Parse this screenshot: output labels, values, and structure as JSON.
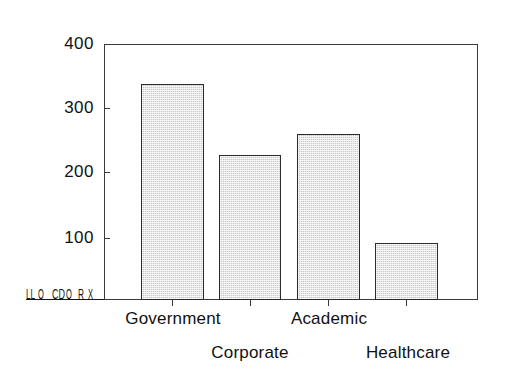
{
  "chart_data": {
    "type": "bar",
    "title": "",
    "subtitle": "",
    "xlabel": "",
    "ylabel": "",
    "categories": [
      "Government",
      "Corporate",
      "Academic",
      "Healthcare"
    ],
    "values": [
      335,
      220,
      250,
      85
    ],
    "series": [
      {
        "name": "",
        "values": [
          335,
          220,
          250,
          85
        ]
      }
    ],
    "ylim": [
      0,
      400
    ],
    "y_ticks": [
      100,
      200,
      300,
      400
    ],
    "y_tick_labels": [
      "100",
      "200",
      "300",
      "400"
    ],
    "grid": false,
    "legend": false,
    "legend_position": "none",
    "annotations": [],
    "bar_fill_color": "#c8c8c8",
    "bar_edge_color": "#2b2b2b",
    "axis_color": "#3a3a3a",
    "background_color": "#ffffff",
    "label_layout": "staggered-two-rows",
    "origin_artifact_text": "LL.OCHOX"
  },
  "axes": {
    "y_ticks": [
      {
        "label": "400",
        "value": 400,
        "y": 44
      },
      {
        "label": "300",
        "value": 300,
        "y": 108
      },
      {
        "label": "200",
        "value": 200,
        "y": 172
      },
      {
        "label": "100",
        "value": 100,
        "y": 238
      }
    ],
    "x_ticks": [
      {
        "x": 172
      },
      {
        "x": 250
      },
      {
        "x": 328
      },
      {
        "x": 406
      }
    ]
  },
  "bars": [
    {
      "name": "Government",
      "value": 335,
      "left": 141,
      "width": 63,
      "height": 216,
      "row": 1,
      "label_left": 103,
      "label_width": 140
    },
    {
      "name": "Corporate",
      "value": 220,
      "left": 219,
      "width": 62,
      "height": 145,
      "row": 2,
      "label_left": 185,
      "label_width": 130
    },
    {
      "name": "Academic",
      "value": 250,
      "left": 297,
      "width": 63,
      "height": 166,
      "row": 1,
      "label_left": 268,
      "label_width": 122
    },
    {
      "name": "Healthcare",
      "value": 85,
      "left": 375,
      "width": 63,
      "height": 57,
      "row": 2,
      "label_left": 338,
      "label_width": 140
    }
  ],
  "origin_artifact": {
    "glyphs": [
      "LL",
      "O",
      "CD",
      "O",
      "R",
      "X"
    ]
  }
}
